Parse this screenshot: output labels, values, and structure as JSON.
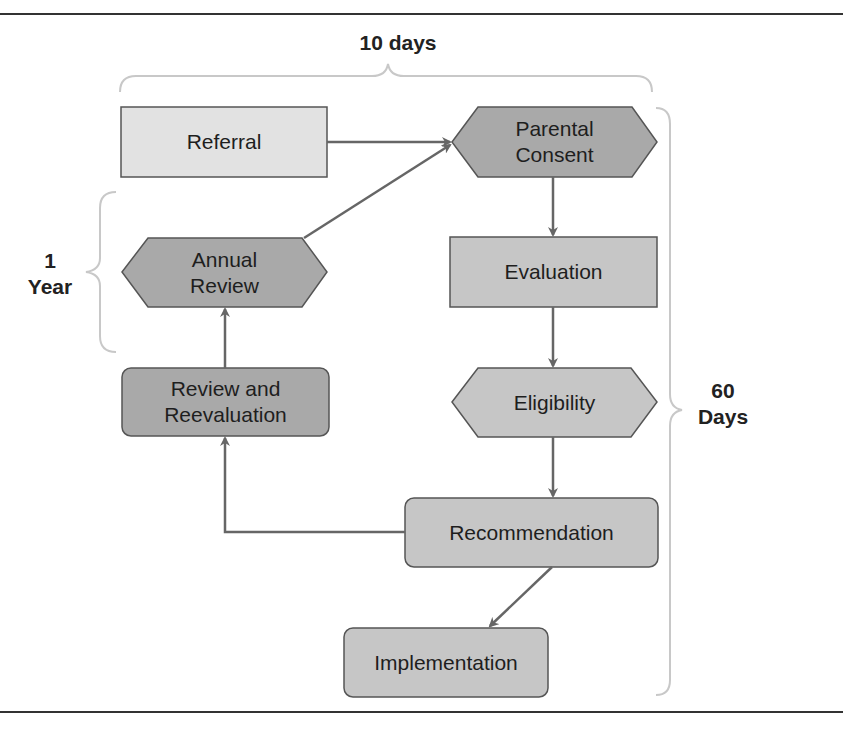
{
  "colors": {
    "light_fill": "#e2e2e2",
    "medium_fill": "#c6c6c6",
    "dark_fill": "#a9a9a9",
    "stroke": "#555555",
    "arrow": "#666666",
    "bracket": "#c8c8c8",
    "rule": "#333333"
  },
  "brackets": {
    "top": {
      "label": "10 days"
    },
    "left": {
      "line1": "1",
      "line2": "Year"
    },
    "right": {
      "line1": "60",
      "line2": "Days"
    }
  },
  "nodes": {
    "referral": {
      "label": "Referral",
      "shape": "rectangle"
    },
    "parental_consent": {
      "line1": "Parental",
      "line2": "Consent",
      "shape": "hexagon"
    },
    "evaluation": {
      "label": "Evaluation",
      "shape": "rectangle"
    },
    "eligibility": {
      "label": "Eligibility",
      "shape": "hexagon"
    },
    "recommendation": {
      "label": "Recommendation",
      "shape": "rounded-rectangle"
    },
    "implementation": {
      "label": "Implementation",
      "shape": "rounded-rectangle"
    },
    "review_reevaluation": {
      "line1": "Review and",
      "line2": "Reevaluation",
      "shape": "rounded-rectangle"
    },
    "annual_review": {
      "line1": "Annual",
      "line2": "Review",
      "shape": "hexagon"
    }
  },
  "edges": [
    {
      "from": "Referral",
      "to": "Parental Consent"
    },
    {
      "from": "Parental Consent",
      "to": "Evaluation"
    },
    {
      "from": "Evaluation",
      "to": "Eligibility"
    },
    {
      "from": "Eligibility",
      "to": "Recommendation"
    },
    {
      "from": "Recommendation",
      "to": "Implementation"
    },
    {
      "from": "Recommendation",
      "to": "Review and Reevaluation"
    },
    {
      "from": "Review and Reevaluation",
      "to": "Annual Review"
    },
    {
      "from": "Annual Review",
      "to": "Parental Consent"
    }
  ]
}
